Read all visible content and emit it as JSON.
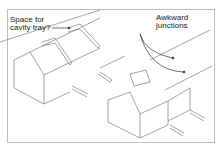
{
  "labels": {
    "cavity_tray": [
      "Space for",
      "cavity tray?"
    ],
    "junctions": [
      "Awkward",
      "junctions"
    ]
  },
  "colors": {
    "line": "#555555",
    "frame": "#bdbdbd",
    "text": "#222222"
  }
}
